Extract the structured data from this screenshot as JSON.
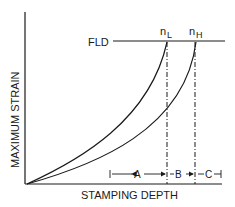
{
  "diagram": {
    "y_axis_label": "MAXIMUM STRAIN",
    "x_axis_label": "STAMPING DEPTH",
    "fld_label": "FLD",
    "curves": [
      {
        "name": "n_L",
        "main": "n",
        "sub": "L"
      },
      {
        "name": "n_H",
        "main": "n",
        "sub": "H"
      }
    ],
    "dimensions": [
      {
        "label": "A"
      },
      {
        "label": "B"
      },
      {
        "label": "C"
      }
    ],
    "colors": {
      "ink": "#1a1a1a",
      "background": "#ffffff"
    }
  }
}
